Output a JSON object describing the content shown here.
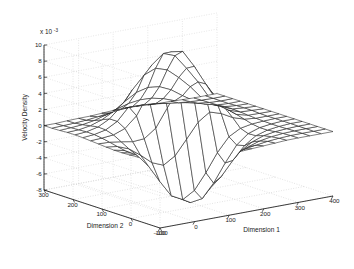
{
  "figure": {
    "kind": "matlab-3d-mesh-surface",
    "background_color": "#ffffff",
    "mesh_color": "#1a1a1a",
    "grid_color": "#c8c8c8",
    "axis_color": "#1a1a1a"
  },
  "axes": {
    "z": {
      "label": "Velocity Density",
      "exponent_prefix": "x 10",
      "exponent_power": "-3",
      "ticks": [
        "10",
        "8",
        "6",
        "4",
        "2",
        "0",
        "-2",
        "-4",
        "-6",
        "-8"
      ],
      "tick_values": [
        10,
        8,
        6,
        4,
        2,
        0,
        -2,
        -4,
        -6,
        -8
      ],
      "limits": [
        -8,
        10
      ]
    },
    "x": {
      "label": "Dimension 1",
      "ticks": [
        "-100",
        "0",
        "100",
        "200",
        "300",
        "400"
      ],
      "tick_values": [
        -100,
        0,
        100,
        200,
        300,
        400
      ],
      "limits": [
        -100,
        400
      ]
    },
    "y": {
      "label": "Dimension 2",
      "ticks": [
        "300",
        "200",
        "100",
        "0",
        "-100"
      ],
      "tick_values": [
        300,
        200,
        100,
        0,
        -100
      ],
      "limits": [
        -100,
        300
      ]
    }
  },
  "chart_data": {
    "type": "surface",
    "title": "",
    "xlabel": "Dimension 1",
    "ylabel": "Dimension 2",
    "zlabel": "Velocity Density",
    "z_scale": 0.001,
    "z_scale_label": "x 10^-3",
    "xlim": [
      -100,
      400
    ],
    "ylim": [
      -100,
      300
    ],
    "zlim": [
      -0.008,
      0.01
    ],
    "grid": true,
    "legend": null,
    "x": [
      -100,
      -60,
      -20,
      20,
      60,
      100,
      140,
      180,
      220,
      260,
      300,
      340,
      400
    ],
    "y": [
      -100,
      -60,
      -20,
      20,
      60,
      100,
      140,
      180,
      220,
      260,
      300
    ],
    "z_units": "1e-3",
    "z": [
      [
        0.0,
        0.0,
        -0.1,
        -0.2,
        -0.3,
        -0.4,
        -0.3,
        -0.2,
        -0.1,
        0.0,
        0.0,
        0.0,
        0.0
      ],
      [
        0.0,
        -0.1,
        -0.3,
        -0.6,
        -1.0,
        -1.3,
        -1.1,
        -0.7,
        -0.3,
        -0.1,
        0.0,
        0.0,
        0.0
      ],
      [
        -0.1,
        -0.3,
        -0.8,
        -1.8,
        -3.0,
        -3.8,
        -3.2,
        -2.0,
        -0.9,
        -0.3,
        -0.1,
        0.0,
        0.0
      ],
      [
        -0.2,
        -0.6,
        -1.8,
        -4.0,
        -6.5,
        -7.6,
        -6.6,
        -4.2,
        -1.9,
        -0.6,
        -0.2,
        0.0,
        0.0
      ],
      [
        -0.2,
        -0.7,
        -2.0,
        -4.6,
        -7.2,
        -7.9,
        -6.2,
        -3.4,
        -1.2,
        -0.3,
        -0.1,
        0.0,
        0.0
      ],
      [
        -0.1,
        -0.3,
        -0.9,
        -1.8,
        -1.6,
        0.6,
        3.2,
        4.2,
        2.6,
        0.8,
        0.1,
        0.0,
        0.0
      ],
      [
        0.0,
        0.1,
        0.4,
        1.6,
        4.4,
        7.8,
        9.5,
        7.4,
        4.4,
        1.5,
        0.3,
        0.1,
        0.0
      ],
      [
        0.1,
        0.3,
        0.9,
        2.4,
        5.0,
        7.2,
        7.6,
        6.0,
        4.0,
        1.6,
        0.4,
        0.1,
        0.0
      ],
      [
        0.1,
        0.2,
        0.6,
        1.4,
        2.6,
        3.6,
        3.8,
        3.2,
        2.0,
        0.9,
        0.2,
        0.0,
        0.0
      ],
      [
        0.0,
        0.1,
        0.2,
        0.5,
        0.9,
        1.2,
        1.3,
        1.1,
        0.7,
        0.3,
        0.1,
        0.0,
        0.0
      ],
      [
        0.0,
        0.0,
        0.1,
        0.1,
        0.2,
        0.3,
        0.3,
        0.2,
        0.1,
        0.1,
        0.0,
        0.0,
        0.0
      ]
    ],
    "peaks": [
      {
        "label": "primary peak",
        "x": 140,
        "y": 140,
        "z": 0.0095
      },
      {
        "label": "secondary peak",
        "x": 180,
        "y": 100,
        "z": 0.006
      }
    ],
    "troughs": [
      {
        "label": "primary trough",
        "x": 100,
        "y": 60,
        "z": -0.0079
      }
    ]
  }
}
